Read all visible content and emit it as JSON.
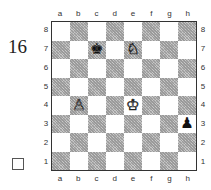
{
  "puzzle": {
    "number": "16",
    "checkbox": ""
  },
  "board": {
    "files": [
      "a",
      "b",
      "c",
      "d",
      "e",
      "f",
      "g",
      "h"
    ],
    "ranks": [
      "8",
      "7",
      "6",
      "5",
      "4",
      "3",
      "2",
      "1"
    ],
    "colors": {
      "light": "#ffffff",
      "dark": "#a8a8a8",
      "border": "#333333"
    },
    "pieces": [
      {
        "square": "c7",
        "piece": "king",
        "color": "black",
        "glyph": "♚"
      },
      {
        "square": "e7",
        "piece": "knight",
        "color": "white",
        "glyph": "♘"
      },
      {
        "square": "b4",
        "piece": "pawn",
        "color": "white",
        "glyph": "♙"
      },
      {
        "square": "e4",
        "piece": "king",
        "color": "white",
        "glyph": "♔"
      },
      {
        "square": "h3",
        "piece": "pawn",
        "color": "black",
        "glyph": "♟"
      }
    ]
  }
}
